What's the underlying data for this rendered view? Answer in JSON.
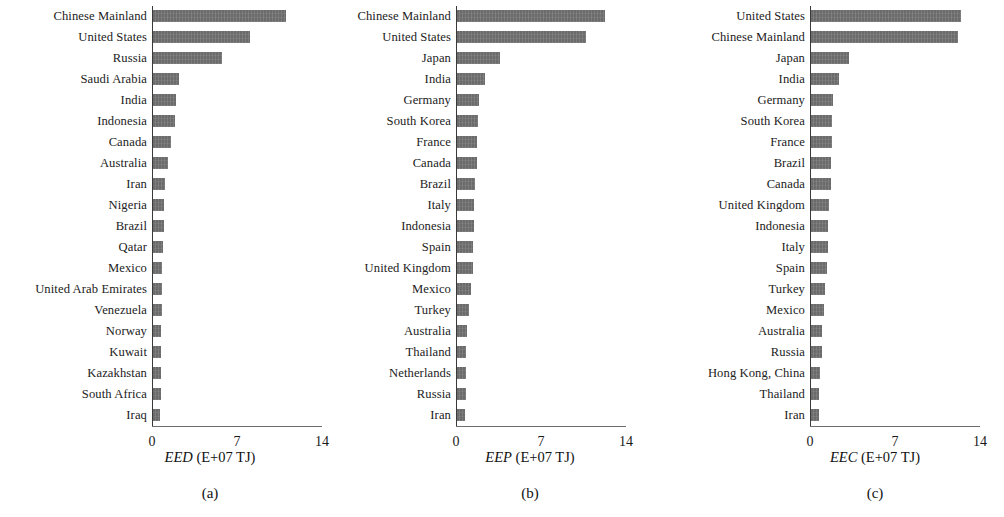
{
  "figure": {
    "unit_note": "E+07 TJ",
    "bar_color": "#6b6b6b",
    "axis_color": "#3a3a3a",
    "background": "#ffffff"
  },
  "chart_data": [
    {
      "type": "bar",
      "orientation": "horizontal",
      "panel": "a",
      "caption": "(a)",
      "title": "",
      "xlabel_symbol": "EED",
      "xlabel_unit": "(E+07 TJ)",
      "xlabel": "EED (E+07 TJ)",
      "ylabel": "",
      "xlim": [
        0,
        14
      ],
      "xticks": [
        0,
        7,
        14
      ],
      "xticklabels": [
        "0",
        "7",
        "14"
      ],
      "grid": false,
      "legend": "none",
      "categories": [
        "Chinese Mainland",
        "United States",
        "Russia",
        "Saudi Arabia",
        "India",
        "Indonesia",
        "Canada",
        "Australia",
        "Iran",
        "Nigeria",
        "Brazil",
        "Qatar",
        "Mexico",
        "United Arab Emirates",
        "Venezuela",
        "Norway",
        "Kuwait",
        "Kazakhstan",
        "South Africa",
        "Iraq"
      ],
      "values": [
        11.0,
        8.1,
        5.8,
        2.2,
        2.0,
        1.9,
        1.6,
        1.3,
        1.1,
        1.0,
        0.95,
        0.9,
        0.85,
        0.8,
        0.8,
        0.75,
        0.75,
        0.7,
        0.7,
        0.65
      ]
    },
    {
      "type": "bar",
      "orientation": "horizontal",
      "panel": "b",
      "caption": "(b)",
      "title": "",
      "xlabel_symbol": "EEP",
      "xlabel_unit": "(E+07 TJ)",
      "xlabel": "EEP (E+07 TJ)",
      "ylabel": "",
      "xlim": [
        0,
        14
      ],
      "xticks": [
        0,
        7,
        14
      ],
      "xticklabels": [
        "0",
        "7",
        "14"
      ],
      "grid": false,
      "legend": "none",
      "categories": [
        "Chinese Mainland",
        "United States",
        "Japan",
        "India",
        "Germany",
        "South Korea",
        "France",
        "Canada",
        "Brazil",
        "Italy",
        "Indonesia",
        "Spain",
        "United Kingdom",
        "Mexico",
        "Turkey",
        "Australia",
        "Thailand",
        "Netherlands",
        "Russia",
        "Iran"
      ],
      "values": [
        12.3,
        10.7,
        3.6,
        2.4,
        1.9,
        1.8,
        1.7,
        1.7,
        1.6,
        1.5,
        1.5,
        1.4,
        1.4,
        1.2,
        1.1,
        0.9,
        0.85,
        0.8,
        0.8,
        0.7
      ]
    },
    {
      "type": "bar",
      "orientation": "horizontal",
      "panel": "c",
      "caption": "(c)",
      "title": "",
      "xlabel_symbol": "EEC",
      "xlabel_unit": "(E+07 TJ)",
      "xlabel": "EEC (E+07 TJ)",
      "ylabel": "",
      "xlim": [
        0,
        14
      ],
      "xticks": [
        0,
        7,
        14
      ],
      "xticklabels": [
        "0",
        "7",
        "14"
      ],
      "grid": false,
      "legend": "none",
      "categories": [
        "United States",
        "Chinese Mainland",
        "Japan",
        "India",
        "Germany",
        "South Korea",
        "France",
        "Brazil",
        "Canada",
        "United Kingdom",
        "Indonesia",
        "Italy",
        "Spain",
        "Turkey",
        "Mexico",
        "Australia",
        "Russia",
        "Hong Kong, China",
        "Thailand",
        "Iran"
      ],
      "values": [
        12.4,
        12.2,
        3.2,
        2.4,
        1.9,
        1.85,
        1.8,
        1.75,
        1.7,
        1.6,
        1.5,
        1.45,
        1.4,
        1.2,
        1.15,
        1.0,
        0.95,
        0.8,
        0.75,
        0.7
      ]
    }
  ]
}
